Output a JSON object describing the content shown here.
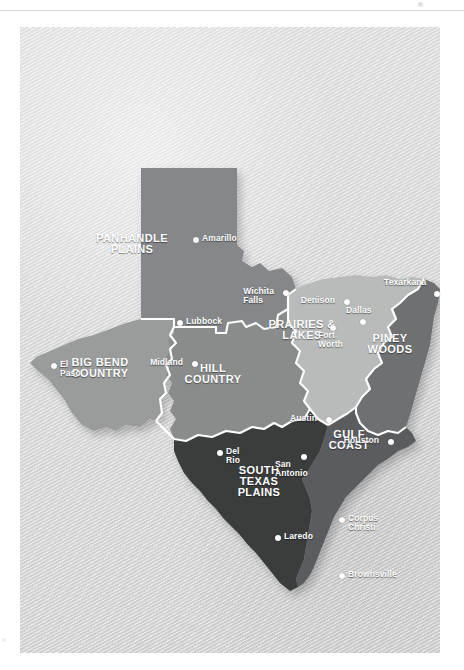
{
  "map": {
    "title": "Texas Travel Regions Map",
    "subject": "Texas",
    "background_color": "#ffffff",
    "panel_color": "#dcdcdc",
    "label_color": "#ffffff",
    "border_color": "#ffffff",
    "regions": [
      {
        "id": "panhandle-plains",
        "label": "PANHANDLE\nPLAINS",
        "color": "#85878a",
        "label_x": 108,
        "label_y": 214
      },
      {
        "id": "big-bend-country",
        "label": "BIG BEND\nCOUNTRY",
        "color": "#9a9c9c",
        "label_x": 78,
        "label_y": 340
      },
      {
        "id": "hill-country",
        "label": "HILL\nCOUNTRY",
        "color": "#8a8c8c",
        "label_x": 192,
        "label_y": 346
      },
      {
        "id": "prairies-and-lakes",
        "label": "PRAIRIES &\nLAKES",
        "color": "#b9bbbb",
        "label_x": 280,
        "label_y": 301
      },
      {
        "id": "piney-woods",
        "label": "PINEY\nWOODS",
        "color": "#6e7072",
        "label_x": 370,
        "label_y": 315
      },
      {
        "id": "gulf-coast",
        "label": "GULF\nCOAST",
        "color": "#5a5c5e",
        "label_x": 328,
        "label_y": 410
      },
      {
        "id": "south-texas-plains",
        "label": "SOUTH\nTEXAS\nPLAINS",
        "color": "#3a3c3c",
        "label_x": 238,
        "label_y": 448
      }
    ],
    "cities": [
      {
        "name": "Amarillo",
        "x": 173,
        "y": 210,
        "anchor": "right"
      },
      {
        "name": "Lubbock",
        "x": 157,
        "y": 293,
        "anchor": "right"
      },
      {
        "name": "Wichita Falls",
        "x": 263,
        "y": 263,
        "anchor": "left"
      },
      {
        "name": "Denison",
        "x": 324,
        "y": 272,
        "anchor": "left"
      },
      {
        "name": "Dallas",
        "x": 340,
        "y": 292,
        "anchor": "above"
      },
      {
        "name": "Fort\nWorth",
        "x": 310,
        "y": 298,
        "anchor": "below"
      },
      {
        "name": "Texarkana",
        "x": 414,
        "y": 264,
        "anchor": "above"
      },
      {
        "name": "El Paso",
        "x": 31,
        "y": 336,
        "anchor": "right"
      },
      {
        "name": "Midland",
        "x": 172,
        "y": 334,
        "anchor": "left"
      },
      {
        "name": "Austin",
        "x": 306,
        "y": 390,
        "anchor": "left"
      },
      {
        "name": "Houston",
        "x": 368,
        "y": 412,
        "anchor": "left"
      },
      {
        "name": "Del Rio",
        "x": 197,
        "y": 423,
        "anchor": "right"
      },
      {
        "name": "San\nAntonio",
        "x": 281,
        "y": 427,
        "anchor": "below"
      },
      {
        "name": "Laredo",
        "x": 255,
        "y": 508,
        "anchor": "right"
      },
      {
        "name": "Corpus Christi",
        "x": 319,
        "y": 490,
        "anchor": "right"
      },
      {
        "name": "Brownsville",
        "x": 319,
        "y": 546,
        "anchor": "right"
      }
    ]
  }
}
